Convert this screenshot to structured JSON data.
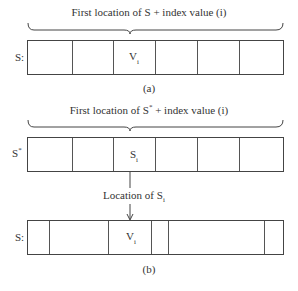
{
  "figure_a": {
    "brace_label": "First location of S + index value (i)",
    "array_label": "S:",
    "cell_value_base": "V",
    "cell_value_sub": "i",
    "caption": "(a)"
  },
  "figure_b": {
    "brace_label_prefix": "First location of S",
    "brace_label_sup": "*",
    "brace_label_suffix": "+ index value (i)",
    "index_array_label_base": "S",
    "index_array_label_sup": "*",
    "index_cell_base": "S",
    "index_cell_sub": "i",
    "pointer_label_prefix": "Location of S",
    "pointer_label_sub": "i",
    "array_label": "S:",
    "cell_value_base": "V",
    "cell_value_sub": "i",
    "caption": "(b)"
  }
}
